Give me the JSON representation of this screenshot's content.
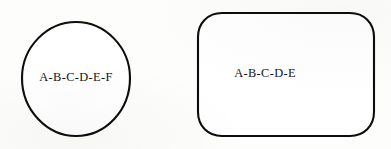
{
  "figure": {
    "background_color": "#fdfdfb",
    "stroke_color": "#0d0d0d",
    "text_color": "#141414",
    "width": 391,
    "height": 149,
    "shapes": [
      {
        "id": "circle",
        "kind": "circle",
        "label": "A-B-C-D-E-F",
        "cx": 76,
        "cy": 79,
        "rx": 54,
        "ry": 57,
        "label_x": 76,
        "label_y": 78
      },
      {
        "id": "rounded-rectangle",
        "kind": "rounded-rectangle",
        "label": "A-B-C-D-E",
        "x": 198,
        "y": 13,
        "width": 176,
        "height": 123,
        "corner_radius": 24,
        "label_x": 265,
        "label_y": 74
      }
    ]
  }
}
